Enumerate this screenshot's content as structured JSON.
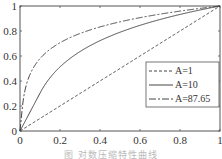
{
  "chart_data": {
    "type": "line",
    "title": "",
    "xlabel": "",
    "ylabel": "",
    "xlim": [
      0,
      1
    ],
    "ylim": [
      0,
      1
    ],
    "grid": false,
    "legend_position": "center-right",
    "x_ticks": [
      "0",
      "0.2",
      "0.4",
      "0.6",
      "0.8",
      "1"
    ],
    "y_ticks": [
      "0",
      "0.2",
      "0.4",
      "0.6",
      "0.8",
      "1"
    ],
    "x": [
      0,
      0.1,
      0.2,
      0.3,
      0.4,
      0.5,
      0.6,
      0.7,
      0.8,
      0.9,
      1.0
    ],
    "series": [
      {
        "name": "A=1",
        "style": "dashed",
        "values": [
          0,
          0.1,
          0.2,
          0.3,
          0.4,
          0.5,
          0.6,
          0.7,
          0.8,
          0.9,
          1.0
        ]
      },
      {
        "name": "A=10",
        "style": "solid",
        "values": [
          0,
          0.303,
          0.513,
          0.636,
          0.722,
          0.79,
          0.845,
          0.892,
          0.932,
          0.968,
          1.0
        ]
      },
      {
        "name": "A=87.65",
        "style": "dash-dot",
        "values": [
          0,
          0.579,
          0.706,
          0.78,
          0.833,
          0.874,
          0.907,
          0.935,
          0.959,
          0.981,
          1.0
        ]
      }
    ],
    "caption": "图 对数压缩特性曲线"
  },
  "legend": {
    "items": [
      "A=1",
      "A=10",
      "A=87.65"
    ]
  },
  "colors": {
    "line": "#444444",
    "axis": "#555555"
  }
}
